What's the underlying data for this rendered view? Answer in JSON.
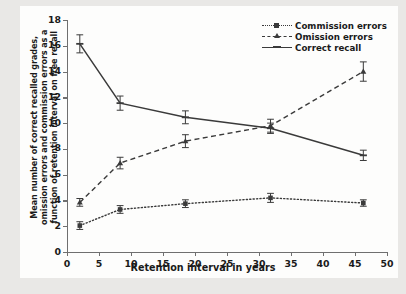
{
  "chart_data": {
    "type": "line",
    "title": "",
    "xlabel": "Retention interval in years",
    "ylabel": "Mean number of correct recalled grades, omission errors and commission errors as a function of retention interval on free recall",
    "ylabel_lines": [
      "Mean number of correct recalled grades,",
      "omission errors and commission errors as a",
      "function of retention interval on free recall"
    ],
    "xlim": [
      0,
      50
    ],
    "ylim": [
      0,
      18
    ],
    "xticks": [
      0,
      5,
      10,
      15,
      20,
      25,
      30,
      35,
      40,
      45,
      50
    ],
    "yticks": [
      0,
      2,
      4,
      6,
      8,
      10,
      12,
      14,
      16,
      18
    ],
    "grid": false,
    "legend_position": "top-right",
    "x": [
      2.0,
      8.3,
      18.5,
      31.8,
      46.3
    ],
    "series": [
      {
        "name": "Commission errors",
        "style": "dotted",
        "marker": "square",
        "values": [
          2.05,
          3.3,
          3.75,
          4.2,
          3.8
        ],
        "errors": [
          0.3,
          0.3,
          0.3,
          0.35,
          0.25
        ]
      },
      {
        "name": "Omission errors",
        "style": "dashed",
        "marker": "triangle",
        "values": [
          3.85,
          6.9,
          8.6,
          9.8,
          14.0
        ],
        "errors": [
          0.3,
          0.45,
          0.5,
          0.5,
          0.75
        ]
      },
      {
        "name": "Correct recall",
        "style": "solid",
        "marker": "plus",
        "values": [
          16.15,
          11.55,
          10.45,
          9.6,
          7.5
        ],
        "errors": [
          0.7,
          0.55,
          0.5,
          0.4,
          0.4
        ]
      }
    ],
    "colors": {
      "line": "#3a3a3a",
      "axis": "#6f6f6f",
      "text": "#1a1a1a",
      "canvas": "#fdfdfc",
      "page_background": "#e9e8e6"
    }
  }
}
